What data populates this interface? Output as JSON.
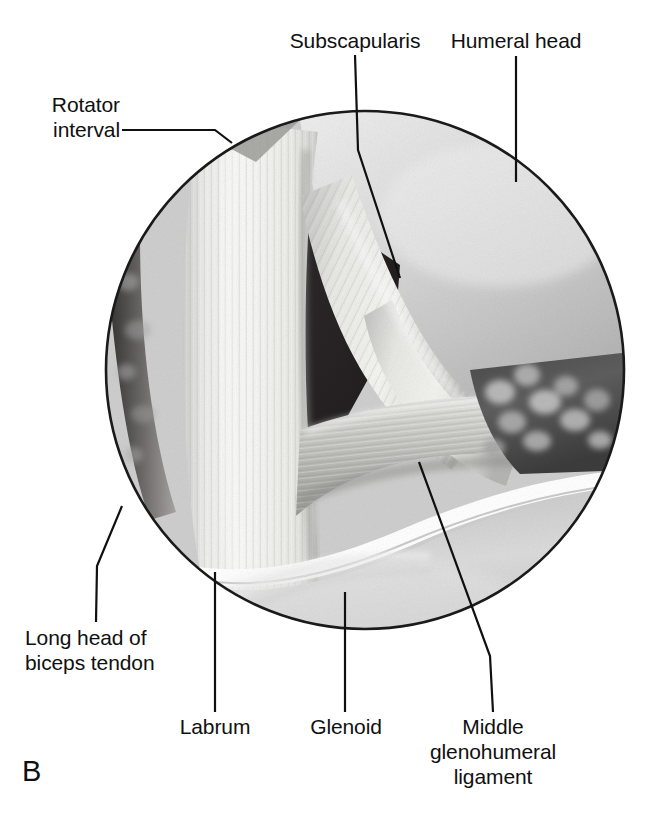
{
  "figure": {
    "panel_letter": "B",
    "view_type": "arthroscopic-circular-view"
  },
  "labels": {
    "rotator_interval": "Rotator\ninterval",
    "rotator_interval_l1": "Rotator",
    "rotator_interval_l2": "interval",
    "subscapularis": "Subscapularis",
    "humeral_head": "Humeral head",
    "long_head_biceps_l1": "Long head of",
    "long_head_biceps_l2": "biceps tendon",
    "labrum": "Labrum",
    "glenoid": "Glenoid",
    "mghl_l1": "Middle",
    "mghl_l2": "glenohumeral",
    "mghl_l3": "ligament"
  },
  "colors": {
    "ink": "#101010",
    "background": "#ffffff",
    "circle_outline": "#1a1a1a",
    "joint_space_dark": "#231f20",
    "humeral_head_light": "#d8d8d8",
    "tendon_bright": "#f2f2f0",
    "ligament_mid": "#b9b9b7",
    "glenoid_surface": "#cfcfcf",
    "labrum_white": "#ffffff",
    "synovium_dark": "#5a5a5a"
  },
  "geometry": {
    "circle_center_x": 365,
    "circle_center_y": 370,
    "circle_radius": 260
  }
}
